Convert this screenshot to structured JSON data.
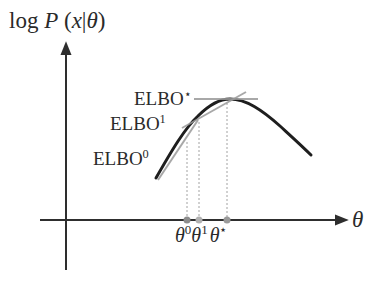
{
  "y_axis_label": {
    "prefix": "log ",
    "P": "P",
    "rest": " (",
    "x": "x",
    "bar": "|",
    "theta": "θ",
    "close": ")"
  },
  "x_axis_label": "θ",
  "elbo_labels": [
    {
      "base": "ELBO",
      "sup": "⋆"
    },
    {
      "base": "ELBO",
      "sup": "1"
    },
    {
      "base": "ELBO",
      "sup": "0"
    }
  ],
  "theta_ticks": [
    {
      "base": "θ",
      "sup": "0"
    },
    {
      "base": "θ",
      "sup": "1"
    },
    {
      "base": "θ",
      "sup": "⋆"
    }
  ],
  "colors": {
    "axis": "#2e2e2e",
    "curve": "#1e1e1e",
    "tangent": "#9a9a9a",
    "dotted": "#8a8a8a",
    "point0": "#8c8c8c",
    "point1": "#b0b0b0",
    "pointstar": "#9a9a9a"
  }
}
